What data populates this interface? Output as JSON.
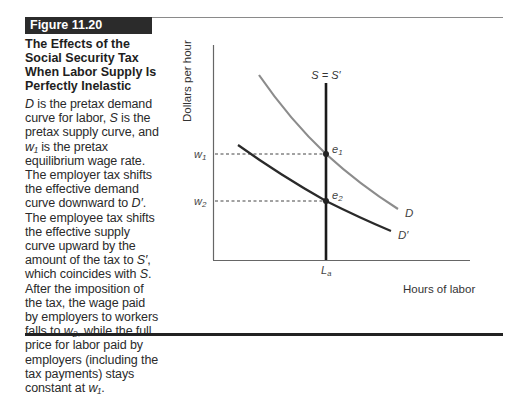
{
  "figure": {
    "label": "Figure 11.20",
    "title": "The Effects of the Social Security Tax When Labor Supply Is Perfectly Inelastic",
    "caption_segments": [
      {
        "t": "D",
        "i": true
      },
      {
        "t": " is the pretax demand curve for labor, ",
        "i": false
      },
      {
        "t": "S",
        "i": true
      },
      {
        "t": " is the pretax supply curve, and ",
        "i": false
      },
      {
        "t": "w₁",
        "i": true
      },
      {
        "t": " is the pretax equilibrium wage rate. The employer tax shifts the effective demand curve downward to ",
        "i": false
      },
      {
        "t": "D′",
        "i": true
      },
      {
        "t": ". The employee tax shifts the effective supply curve upward by the amount of the tax to ",
        "i": false
      },
      {
        "t": "S′",
        "i": true
      },
      {
        "t": ", which coincides with ",
        "i": false
      },
      {
        "t": "S",
        "i": true
      },
      {
        "t": ". After the imposition of the tax, the wage paid by employers to workers falls to ",
        "i": false
      },
      {
        "t": "w₂",
        "i": true
      },
      {
        "t": ", while the full price for labor paid by employers (including the tax payments) stays constant at ",
        "i": false
      },
      {
        "t": "w₁",
        "i": true
      },
      {
        "t": ".",
        "i": false
      }
    ]
  },
  "chart_data": {
    "type": "line",
    "title": "The Effects of the Social Security Tax When Labor Supply Is Perfectly Inelastic",
    "xlabel": "Hours of labor",
    "ylabel": "Dollars per hour",
    "x_ticks": [
      "L_a"
    ],
    "y_ticks": [
      "w₁",
      "w₂"
    ],
    "grid": false,
    "series": [
      {
        "name": "D",
        "color": "#8c8c8c",
        "description": "pretax demand curve, downward sloping, passes through e1"
      },
      {
        "name": "D′",
        "color": "#2a2a2a",
        "description": "post-tax effective demand curve, shifted down, passes through e2"
      },
      {
        "name": "S = S′",
        "color": "#1a1a1a",
        "description": "perfectly inelastic supply, vertical at L_a"
      }
    ],
    "points": [
      {
        "label": "e₁",
        "x": "L_a",
        "y": "w₁"
      },
      {
        "label": "e₂",
        "x": "L_a",
        "y": "w₂"
      }
    ],
    "dashed_guides": [
      "w₁",
      "w₂"
    ]
  },
  "labels": {
    "y_axis": "Dollars per hour",
    "x_axis": "Hours of labor",
    "supply": "S = S′",
    "demand": "D",
    "demand_shifted": "D′",
    "w1": "w",
    "w1_sub": "1",
    "w2": "w",
    "w2_sub": "2",
    "e1": "e",
    "e1_sub": "1",
    "e2": "e",
    "e2_sub": "2",
    "la": "L",
    "la_sub": "a"
  }
}
